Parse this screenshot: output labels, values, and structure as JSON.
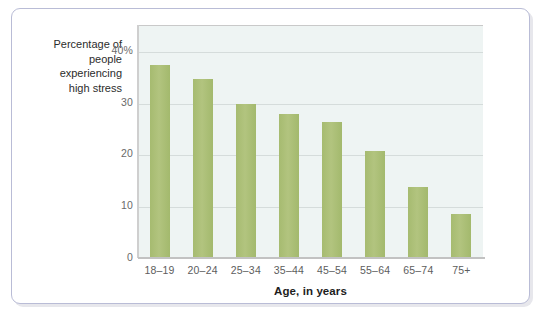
{
  "chart_data": {
    "type": "bar",
    "title": "",
    "subtitle": "",
    "xlabel": "Age, in years",
    "ylabel": "Percentage of people experiencing high stress",
    "ylabel_lines": [
      "Percentage of",
      "people",
      "experiencing",
      "high stress"
    ],
    "categories": [
      "18–19",
      "20–24",
      "25–34",
      "35–44",
      "45–54",
      "55–64",
      "65–74",
      "75+"
    ],
    "values": [
      37.3,
      34.6,
      29.8,
      27.8,
      26.3,
      20.6,
      13.7,
      8.5
    ],
    "ylim": [
      0,
      45
    ],
    "yticks": [
      0,
      10,
      20,
      30,
      40
    ],
    "ytick_labels": [
      "0",
      "10",
      "20",
      "30",
      "40%"
    ],
    "grid": true,
    "grid_axis": "y",
    "legend": "none",
    "series": [
      {
        "name": "Percentage of people experiencing high stress",
        "values": [
          37.3,
          34.6,
          29.8,
          27.8,
          26.3,
          20.6,
          13.7,
          8.5
        ]
      }
    ]
  },
  "style": {
    "bar_color": "#a8bd72",
    "plot_background": "#eef4f3",
    "grid_color": "#d5dcdb",
    "frame_border_color": "#b9bcd6",
    "axis_color": "#c2c2c2",
    "tick_text_color": "#6a6a6a",
    "axis_title_color": "#1d1d1d"
  }
}
